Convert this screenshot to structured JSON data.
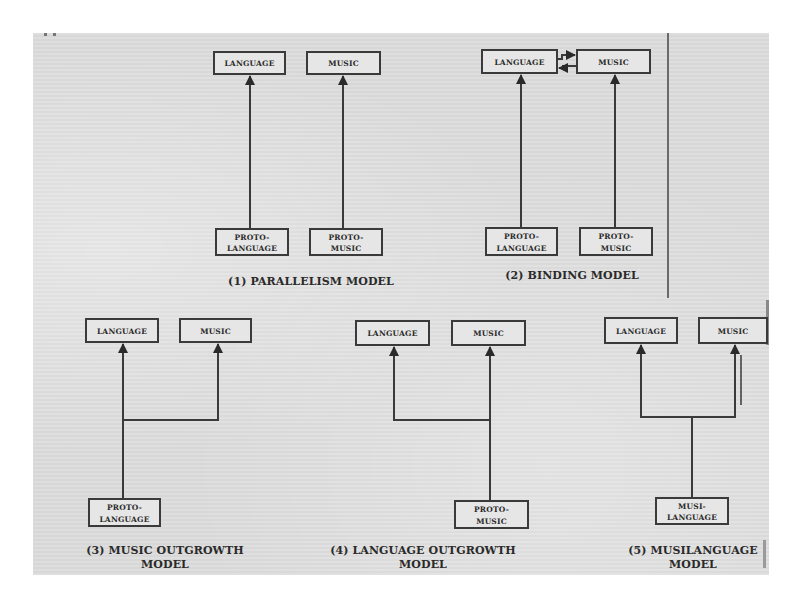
{
  "figure": {
    "page_background": "#dcdcdc",
    "line_color": "#3a3a3a",
    "models": [
      {
        "id": "parallelism",
        "caption_line1": "(1) PARALLELISM MODEL",
        "caption_line2": "",
        "nodes": {
          "language": "LANGUAGE",
          "music": "MUSIC",
          "source_left_line1": "PROTO-",
          "source_left_line2": "LANGUAGE",
          "source_right_line1": "PROTO-",
          "source_right_line2": "MUSIC"
        },
        "edges": [
          {
            "from": "PROTO-LANGUAGE",
            "to": "LANGUAGE"
          },
          {
            "from": "PROTO-MUSIC",
            "to": "MUSIC"
          }
        ]
      },
      {
        "id": "binding",
        "caption_line1": "(2) BINDING MODEL",
        "caption_line2": "",
        "nodes": {
          "language": "LANGUAGE",
          "music": "MUSIC",
          "source_left_line1": "PROTO-",
          "source_left_line2": "LANGUAGE",
          "source_right_line1": "PROTO-",
          "source_right_line2": "MUSIC"
        },
        "edges": [
          {
            "from": "PROTO-LANGUAGE",
            "to": "LANGUAGE"
          },
          {
            "from": "PROTO-MUSIC",
            "to": "MUSIC"
          },
          {
            "from": "LANGUAGE",
            "to": "MUSIC"
          },
          {
            "from": "MUSIC",
            "to": "LANGUAGE"
          }
        ]
      },
      {
        "id": "music-outgrowth",
        "caption_line1": "(3) MUSIC OUTGROWTH",
        "caption_line2": "MODEL",
        "nodes": {
          "language": "LANGUAGE",
          "music": "MUSIC",
          "source_line1": "PROTO-",
          "source_line2": "LANGUAGE"
        },
        "edges": [
          {
            "from": "PROTO-LANGUAGE",
            "to": "LANGUAGE"
          },
          {
            "from": "PROTO-LANGUAGE",
            "to": "MUSIC"
          }
        ]
      },
      {
        "id": "language-outgrowth",
        "caption_line1": "(4) LANGUAGE OUTGROWTH",
        "caption_line2": "MODEL",
        "nodes": {
          "language": "LANGUAGE",
          "music": "MUSIC",
          "source_line1": "PROTO-",
          "source_line2": "MUSIC"
        },
        "edges": [
          {
            "from": "PROTO-MUSIC",
            "to": "MUSIC"
          },
          {
            "from": "PROTO-MUSIC",
            "to": "LANGUAGE"
          }
        ]
      },
      {
        "id": "musilanguage",
        "caption_line1": "(5) MUSILANGUAGE",
        "caption_line2": "MODEL",
        "nodes": {
          "language": "LANGUAGE",
          "music": "MUSIC",
          "source_line1": "MUSI-",
          "source_line2": "LANGUAGE"
        },
        "edges": [
          {
            "from": "MUSILANGUAGE",
            "to": "LANGUAGE"
          },
          {
            "from": "MUSILANGUAGE",
            "to": "MUSIC"
          }
        ]
      }
    ]
  }
}
